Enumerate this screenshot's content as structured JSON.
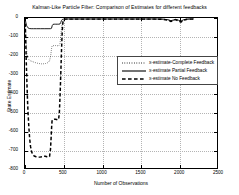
{
  "chart_data": {
    "type": "line",
    "title": "Kalman-Like Particle Filter: Comparison of Estimates for different feedbacks",
    "xlabel": "Number of Observations",
    "ylabel": "State Estimate",
    "xlim": [
      0,
      2500
    ],
    "ylim": [
      -800,
      0
    ],
    "xticks": [
      0,
      500,
      1000,
      1500,
      2000,
      2500
    ],
    "xticklabels": [
      "0",
      "500",
      "1000",
      "1500",
      "2000",
      "2500"
    ],
    "yticks": [
      0,
      -100,
      -200,
      -300,
      -400,
      -500,
      -600,
      -700,
      -800
    ],
    "yticklabels": [
      "0",
      "-100",
      "-200",
      "-300",
      "-400",
      "-500",
      "-600",
      "-700",
      "-800"
    ],
    "grid": true,
    "legend_position": "center-right",
    "series": [
      {
        "name": "x-estimate-Complete Feedback",
        "style": "dotted",
        "color": "#000000",
        "points": [
          [
            0,
            0
          ],
          [
            8,
            -60
          ],
          [
            16,
            -140
          ],
          [
            26,
            -196
          ],
          [
            36,
            -214
          ],
          [
            50,
            -222
          ],
          [
            70,
            -228
          ],
          [
            95,
            -232
          ],
          [
            120,
            -236
          ],
          [
            150,
            -240
          ],
          [
            185,
            -243
          ],
          [
            225,
            -245
          ],
          [
            265,
            -243
          ],
          [
            300,
            -238
          ],
          [
            320,
            -228
          ],
          [
            335,
            -200
          ],
          [
            345,
            -165
          ],
          [
            352,
            -150
          ],
          [
            360,
            -148
          ],
          [
            380,
            -147
          ],
          [
            400,
            -147
          ],
          [
            420,
            -148
          ],
          [
            440,
            -148
          ],
          [
            455,
            -140
          ],
          [
            465,
            -100
          ],
          [
            475,
            -55
          ],
          [
            485,
            -26
          ],
          [
            495,
            -14
          ],
          [
            510,
            -9
          ],
          [
            530,
            -7
          ],
          [
            560,
            -6
          ],
          [
            600,
            -6
          ],
          [
            700,
            -6
          ],
          [
            800,
            -6
          ],
          [
            900,
            -6
          ],
          [
            1000,
            -6
          ],
          [
            1100,
            -6
          ],
          [
            1200,
            -6
          ],
          [
            1300,
            -6
          ],
          [
            1400,
            -6
          ],
          [
            1500,
            -6
          ],
          [
            1600,
            -6
          ],
          [
            1700,
            -6
          ],
          [
            1800,
            -7
          ],
          [
            1860,
            -10
          ],
          [
            1900,
            -16
          ],
          [
            1930,
            -13
          ],
          [
            1960,
            -8
          ],
          [
            2000,
            -14
          ],
          [
            2030,
            -20
          ],
          [
            2060,
            -12
          ],
          [
            2100,
            -7
          ],
          [
            2150,
            -6
          ],
          [
            2200,
            -6
          ]
        ]
      },
      {
        "name": "x-estimate Partial Feedback",
        "style": "solid",
        "color": "#000000",
        "points": [
          [
            0,
            0
          ],
          [
            10,
            -22
          ],
          [
            22,
            -42
          ],
          [
            38,
            -52
          ],
          [
            55,
            -56
          ],
          [
            80,
            -57
          ],
          [
            110,
            -57
          ],
          [
            150,
            -57
          ],
          [
            200,
            -57
          ],
          [
            250,
            -57
          ],
          [
            300,
            -57
          ],
          [
            330,
            -57
          ],
          [
            345,
            -55
          ],
          [
            355,
            -40
          ],
          [
            365,
            -34
          ],
          [
            380,
            -33
          ],
          [
            400,
            -33
          ],
          [
            420,
            -33
          ],
          [
            440,
            -33
          ],
          [
            455,
            -32
          ],
          [
            465,
            -24
          ],
          [
            475,
            -14
          ],
          [
            485,
            -8
          ],
          [
            500,
            -6
          ],
          [
            530,
            -5
          ],
          [
            570,
            -5
          ],
          [
            620,
            -5
          ],
          [
            700,
            -5
          ],
          [
            800,
            -5
          ],
          [
            900,
            -5
          ],
          [
            1000,
            -5
          ],
          [
            1100,
            -5
          ],
          [
            1200,
            -5
          ],
          [
            1300,
            -5
          ],
          [
            1400,
            -5
          ],
          [
            1500,
            -5
          ],
          [
            1600,
            -5
          ],
          [
            1700,
            -5
          ],
          [
            1800,
            -6
          ],
          [
            1860,
            -9
          ],
          [
            1900,
            -14
          ],
          [
            1930,
            -11
          ],
          [
            1960,
            -7
          ],
          [
            2000,
            -12
          ],
          [
            2030,
            -17
          ],
          [
            2060,
            -10
          ],
          [
            2100,
            -6
          ],
          [
            2150,
            -5
          ],
          [
            2200,
            -5
          ]
        ]
      },
      {
        "name": "x-estimate No Feedback",
        "style": "dashed",
        "color": "#000000",
        "points": [
          [
            0,
            0
          ],
          [
            6,
            -70
          ],
          [
            12,
            -160
          ],
          [
            18,
            -255
          ],
          [
            25,
            -345
          ],
          [
            32,
            -430
          ],
          [
            40,
            -510
          ],
          [
            50,
            -580
          ],
          [
            60,
            -640
          ],
          [
            72,
            -685
          ],
          [
            85,
            -712
          ],
          [
            100,
            -728
          ],
          [
            120,
            -736
          ],
          [
            145,
            -740
          ],
          [
            170,
            -742
          ],
          [
            195,
            -742
          ],
          [
            220,
            -740
          ],
          [
            245,
            -738
          ],
          [
            265,
            -737
          ],
          [
            285,
            -740
          ],
          [
            305,
            -742
          ],
          [
            320,
            -738
          ],
          [
            332,
            -700
          ],
          [
            340,
            -640
          ],
          [
            347,
            -580
          ],
          [
            352,
            -550
          ],
          [
            358,
            -543
          ],
          [
            368,
            -541
          ],
          [
            380,
            -540
          ],
          [
            395,
            -540
          ],
          [
            410,
            -541
          ],
          [
            425,
            -543
          ],
          [
            438,
            -540
          ],
          [
            448,
            -500
          ],
          [
            455,
            -430
          ],
          [
            462,
            -350
          ],
          [
            468,
            -270
          ],
          [
            474,
            -190
          ],
          [
            480,
            -120
          ],
          [
            486,
            -65
          ],
          [
            492,
            -30
          ],
          [
            498,
            -14
          ],
          [
            508,
            -8
          ],
          [
            525,
            -6
          ],
          [
            560,
            -6
          ],
          [
            620,
            -6
          ],
          [
            700,
            -6
          ],
          [
            800,
            -6
          ],
          [
            900,
            -6
          ],
          [
            1000,
            -6
          ],
          [
            1100,
            -6
          ],
          [
            1200,
            -6
          ],
          [
            1300,
            -6
          ],
          [
            1400,
            -6
          ],
          [
            1500,
            -6
          ],
          [
            1600,
            -6
          ],
          [
            1700,
            -6
          ],
          [
            1800,
            -7
          ],
          [
            1860,
            -11
          ],
          [
            1900,
            -18
          ],
          [
            1930,
            -14
          ],
          [
            1960,
            -9
          ],
          [
            2000,
            -16
          ],
          [
            2030,
            -22
          ],
          [
            2060,
            -13
          ],
          [
            2100,
            -8
          ],
          [
            2150,
            -6
          ],
          [
            2200,
            -6
          ]
        ]
      }
    ]
  },
  "legend": {
    "items": [
      {
        "label": "x-estimate-Complete Feedback",
        "style": "dotted"
      },
      {
        "label": "x-estimate Partial Feedback",
        "style": "solid"
      },
      {
        "label": "x-estimate No Feedback",
        "style": "dashed"
      }
    ]
  }
}
